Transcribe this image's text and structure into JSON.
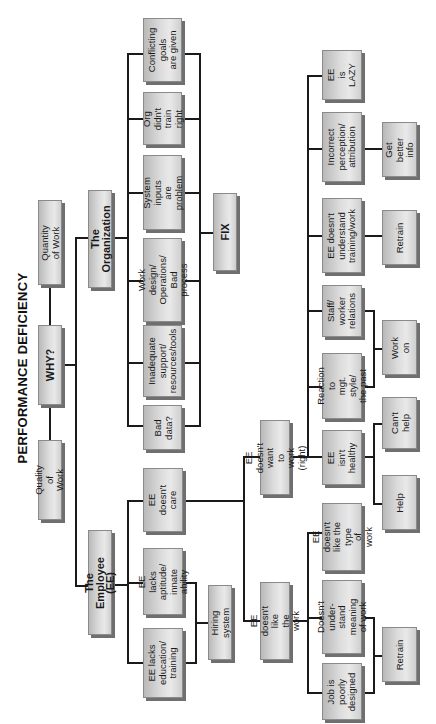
{
  "title": "PERFORMANCE DEFICIENCY",
  "top_row": {
    "quantity": "Quantity of Work",
    "why": "WHY?",
    "quality": "Quality of Work"
  },
  "branches": {
    "organization": "The Organization",
    "employee": "The Employee (EE)"
  },
  "organization_causes": [
    "Conflicting\ngoals\nare given",
    "Org\ndidn't train\nright",
    "System inputs\nare\nproblem",
    "Work design/\nOperations/\nBad process",
    "Inadequate\nsupport/\nresources/tools",
    "Bad\ndata?"
  ],
  "organization_fix": "FIX",
  "employee_causes": [
    "EE\ndoesn't\ncare",
    "EE lacks\naptitude/\ninnate ability",
    "EE lacks\neducation/\ntraining"
  ],
  "hiring_system": "Hiring system",
  "doesnt_care_branches": {
    "doesnt_want": "EE doesn't want\nto work (right)",
    "doesnt_like": "EE doesn't like\nthe work"
  },
  "doesnt_want_causes": [
    "EE\nis\nLAZY",
    "Incorrect\nperception/\nattribution",
    "EE doesn't\nunderstand\ntraining/work",
    "Staff/\nworker\nrelations",
    "Reaction to\nmgt. style/\nthe past",
    "EE\nisn't\nhealthy"
  ],
  "doesnt_like_causes": [
    "EE doesn't\nlike the type\nof work",
    "Doesn't under-\nstand meaning\nof work",
    "Job is\npoorly\ndesigned"
  ],
  "remedies": {
    "get_better_info": "Get better\ninfo",
    "retrain_1": "Retrain",
    "work_on": "Work\non",
    "cant_help": "Can't\nhelp",
    "help": "Help",
    "retrain_2": "Retrain"
  },
  "colors": {
    "box_light": "#e9e9e9",
    "box_dark": "#b9b9b9",
    "shadow": "#6f6f6f",
    "line": "#1a1a1a"
  }
}
